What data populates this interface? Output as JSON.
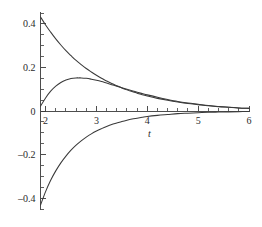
{
  "chart_data": {
    "type": "line",
    "title": "",
    "subtitle": "",
    "xlabel": "t",
    "ylabel": "",
    "xlim": [
      1.9,
      6.0
    ],
    "ylim": [
      -0.45,
      0.45
    ],
    "grid": false,
    "legend": null,
    "legend_position": "none",
    "x_ticks": [
      2,
      3,
      4,
      5,
      6
    ],
    "x_tick_labels": [
      "2",
      "3",
      "4",
      "5",
      "6"
    ],
    "x_minor_tick_step": 0.2,
    "y_ticks": [
      -0.4,
      -0.2,
      0,
      0.2,
      0.4
    ],
    "y_tick_labels": [
      "–0.4",
      "–0.2",
      "0",
      "0.2",
      "0.4"
    ],
    "y_minor_tick_step": 0.05,
    "axis_origin_x": 1.9,
    "series": [
      {
        "name": "curve-upper-decay",
        "color": "#3a3a3a",
        "x": [
          1.9,
          2.0,
          2.1,
          2.2,
          2.3,
          2.4,
          2.5,
          2.6,
          2.7,
          2.8,
          2.9,
          3.0,
          3.1,
          3.2,
          3.3,
          3.4,
          3.5,
          3.6,
          3.7,
          3.8,
          3.9,
          4.0,
          4.2,
          4.4,
          4.6,
          4.8,
          5.0,
          5.2,
          5.4,
          5.6,
          5.8,
          6.0
        ],
        "y": [
          0.432,
          0.395,
          0.362,
          0.331,
          0.303,
          0.277,
          0.254,
          0.232,
          0.213,
          0.195,
          0.179,
          0.164,
          0.15,
          0.138,
          0.126,
          0.116,
          0.106,
          0.097,
          0.089,
          0.082,
          0.075,
          0.069,
          0.058,
          0.049,
          0.041,
          0.034,
          0.029,
          0.024,
          0.02,
          0.017,
          0.014,
          0.012
        ]
      },
      {
        "name": "curve-middle-hump",
        "color": "#3a3a3a",
        "x": [
          1.9,
          2.0,
          2.1,
          2.2,
          2.3,
          2.4,
          2.5,
          2.6,
          2.65,
          2.7,
          2.8,
          2.9,
          3.0,
          3.1,
          3.2,
          3.3,
          3.4,
          3.5,
          3.6,
          3.7,
          3.8,
          3.9,
          4.0,
          4.2,
          4.4,
          4.6,
          4.8,
          5.0,
          5.2,
          5.4,
          5.6,
          5.8,
          6.0
        ],
        "y": [
          0.022,
          0.06,
          0.091,
          0.114,
          0.131,
          0.142,
          0.149,
          0.152,
          0.152,
          0.152,
          0.15,
          0.146,
          0.141,
          0.135,
          0.128,
          0.121,
          0.114,
          0.107,
          0.1,
          0.093,
          0.086,
          0.08,
          0.074,
          0.063,
          0.053,
          0.044,
          0.037,
          0.031,
          0.025,
          0.021,
          0.017,
          0.014,
          0.012
        ]
      },
      {
        "name": "curve-lower-negative",
        "color": "#3a3a3a",
        "x": [
          1.9,
          2.0,
          2.1,
          2.2,
          2.3,
          2.4,
          2.5,
          2.6,
          2.7,
          2.8,
          2.9,
          3.0,
          3.1,
          3.2,
          3.3,
          3.4,
          3.5,
          3.6,
          3.7,
          3.8,
          3.9,
          4.0,
          4.2,
          4.4,
          4.6,
          4.8,
          5.0,
          5.2,
          5.4,
          5.6,
          5.8,
          6.0
        ],
        "y": [
          -0.432,
          -0.37,
          -0.318,
          -0.275,
          -0.238,
          -0.207,
          -0.18,
          -0.157,
          -0.137,
          -0.12,
          -0.105,
          -0.092,
          -0.081,
          -0.071,
          -0.062,
          -0.055,
          -0.048,
          -0.042,
          -0.037,
          -0.033,
          -0.029,
          -0.025,
          -0.02,
          -0.016,
          -0.012,
          -0.01,
          -0.008,
          -0.006,
          -0.005,
          -0.004,
          -0.003,
          -0.002
        ]
      }
    ]
  },
  "figure": {
    "background_color": "#ffffff",
    "axis_color": "#3a3a3a",
    "curve_color": "#3a3a3a",
    "text_color": "#2a2a2a"
  }
}
